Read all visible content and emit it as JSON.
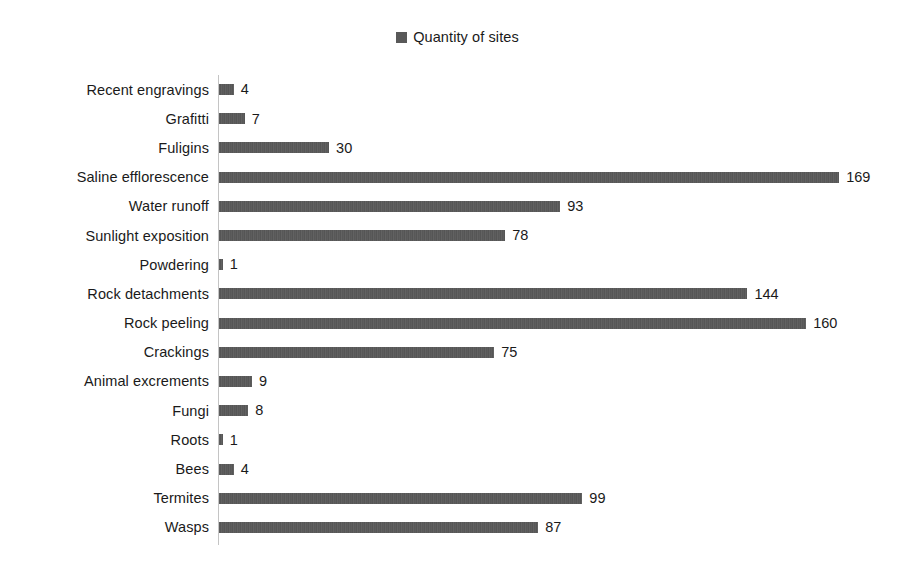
{
  "legend": {
    "swatch_name": "legend-color-swatch",
    "label": "Quantity of sites",
    "color": "#595959"
  },
  "axis": {
    "color": "#c4c4c4",
    "px_per_unit": 3.67,
    "origin_x": 218
  },
  "chart_data": {
    "type": "bar",
    "orientation": "horizontal",
    "title": "",
    "subtitle": "",
    "xlabel": "",
    "ylabel": "",
    "grid": false,
    "legend_position": "top-center",
    "legend_entries": [
      "Quantity of sites"
    ],
    "bar_color": "#595959",
    "xlim": [
      0,
      169
    ],
    "data_labels": true,
    "categories": [
      "Recent engravings",
      "Grafitti",
      "Fuligins",
      "Saline efflorescence",
      "Water runoff",
      "Sunlight exposition",
      "Powdering",
      "Rock detachments",
      "Rock peeling",
      "Crackings",
      "Animal excrements",
      "Fungi",
      "Roots",
      "Bees",
      "Termites",
      "Wasps"
    ],
    "values": [
      4,
      7,
      30,
      169,
      93,
      78,
      1,
      144,
      160,
      75,
      9,
      8,
      1,
      4,
      99,
      87
    ],
    "series": [
      {
        "name": "Quantity of sites",
        "values": [
          4,
          7,
          30,
          169,
          93,
          78,
          1,
          144,
          160,
          75,
          9,
          8,
          1,
          4,
          99,
          87
        ]
      }
    ]
  }
}
